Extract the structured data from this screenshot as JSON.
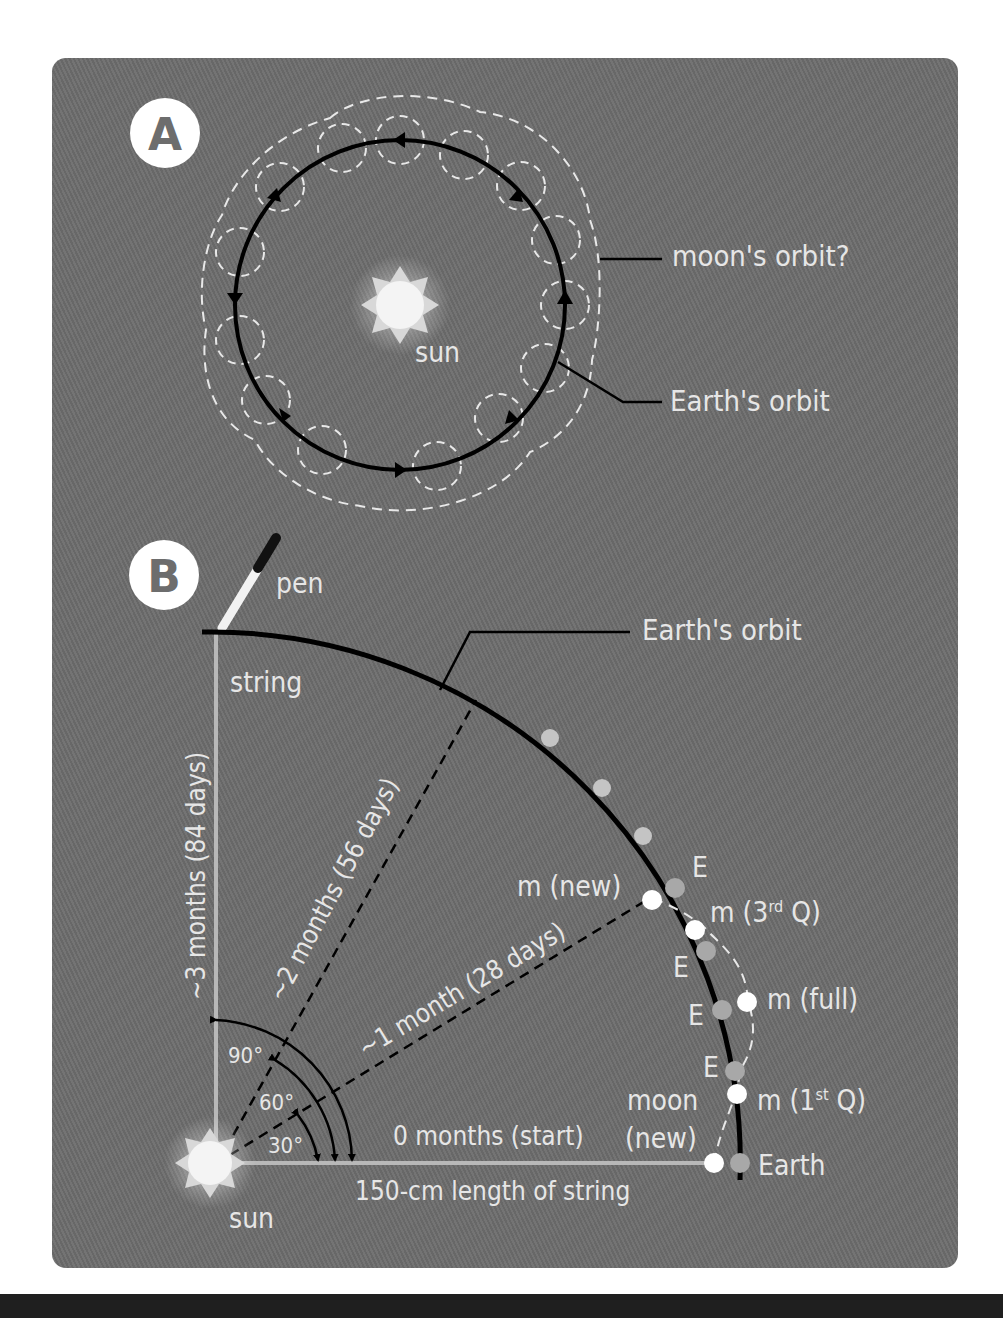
{
  "colors": {
    "panel_bg": "#6d6d6d",
    "text": "#e6e6e6",
    "orbit_line": "#000000",
    "moon_orbit_dashed": "#e8e8e8",
    "string": "#b8b8b8",
    "earth_dot": "#a8a8a8",
    "moon_dot": "#ffffff",
    "orbit_marker_dot": "#c4c4c4",
    "sun_outer": "#d8d8d8",
    "sun_inner": "#f4f4f4",
    "bottom_bar": "#1f1f1f"
  },
  "panel_a": {
    "badge": "A",
    "sun_label": "sun",
    "moon_orbit_label": "moon's orbit?",
    "earth_orbit_label": "Earth's orbit"
  },
  "panel_b": {
    "badge": "B",
    "pen_label": "pen",
    "string_label": "string",
    "earth_orbit_label": "Earth's orbit",
    "sun_label": "sun",
    "radius_labels": {
      "three_months": "~3 months (84 days)",
      "two_months": "~2 months (56 days)",
      "one_month": "~1 month (28 days)",
      "zero_months": "0 months (start)",
      "string_length": "150-cm length of string"
    },
    "angles": [
      "90°",
      "60°",
      "30°"
    ],
    "positions": {
      "earth": "Earth",
      "moon_new_start_line1": "moon",
      "moon_new_start_line2": "(new)",
      "e_label": "E",
      "m_first_q": "m (1",
      "m_first_q_sup": "st",
      "m_first_q_end": " Q)",
      "m_full": "m (full)",
      "m_third_q": "m (3",
      "m_third_q_sup": "rd",
      "m_third_q_end": " Q)",
      "m_new": "m (new)"
    }
  }
}
